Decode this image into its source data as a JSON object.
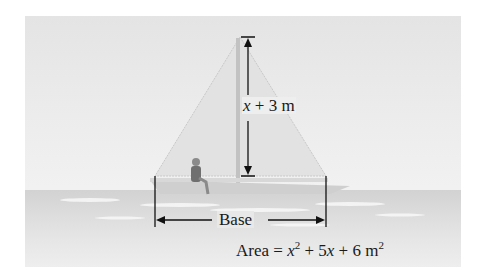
{
  "figure": {
    "height_label": {
      "var": "x",
      "rest": " + 3 m"
    },
    "base_label": "Base",
    "area_label": {
      "prefix": "Area = ",
      "var1": "x",
      "exp1": "2",
      "mid": " + 5",
      "var2": "x",
      "suffix": " + 6 m",
      "exp2": "2"
    }
  },
  "colors": {
    "sky": "#e8e8e8",
    "water": "#d8d8d8",
    "sail": "#e3e3e3",
    "mast": "#bfbfbf",
    "ink": "#1a1a1a"
  }
}
